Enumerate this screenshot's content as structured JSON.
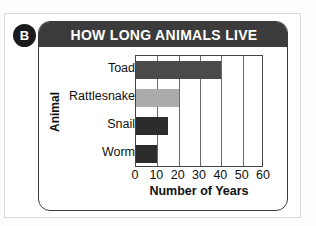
{
  "badge": {
    "label": "B"
  },
  "card": {
    "title": "HOW LONG ANIMALS LIVE"
  },
  "chart_data": {
    "type": "bar",
    "orientation": "horizontal",
    "title": "HOW LONG ANIMALS LIVE",
    "xlabel": "Number of Years",
    "ylabel": "Animal",
    "categories": [
      "Toad",
      "Rattlesnake",
      "Snail",
      "Worm"
    ],
    "values": [
      40,
      20,
      15,
      10
    ],
    "bar_colors": [
      "#4a4a4a",
      "#ababab",
      "#2c2c2c",
      "#2c2c2c"
    ],
    "xlim": [
      0,
      60
    ],
    "xticks": [
      0,
      10,
      20,
      30,
      40,
      50,
      60
    ],
    "xtick_labels": [
      "0",
      "10",
      "20",
      "30",
      "40",
      "50",
      "60"
    ],
    "grid": "vertical",
    "legend": "none"
  },
  "colors": {
    "header_bg": "#3b3b3b",
    "header_text": "#ffffff",
    "badge_bg": "#1b1b1b",
    "axis": "#444444",
    "page_frame": "#d9d9d9"
  }
}
